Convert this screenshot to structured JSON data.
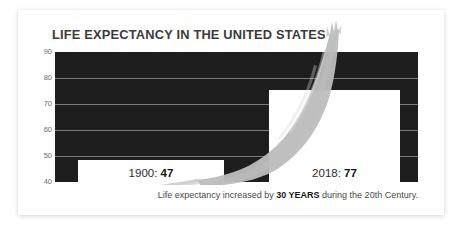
{
  "title": "LIFE EXPECTANCY IN THE UNITED STATES",
  "caption": {
    "prefix": "Life expectancy increased by ",
    "highlight": "30 YEARS",
    "suffix": " during the 20th Century."
  },
  "bars": [
    {
      "label_year": "1900: ",
      "label_value": "47",
      "year": 1900,
      "value": 47
    },
    {
      "label_year": "2018: ",
      "label_value": "77",
      "year": 2018,
      "value": 77
    }
  ],
  "colors": {
    "plot_background": "#1e1e1e",
    "bar_fill": "#ffffff",
    "gridline": "#8d8d8d",
    "brush_stroke": "#bdbdbd",
    "title_text": "#3b3b3b",
    "caption_text": "#4a4a4a",
    "card_background": "#ffffff"
  },
  "chart_data": {
    "type": "bar",
    "title": "LIFE EXPECTANCY IN THE UNITED STATES",
    "xlabel": "",
    "ylabel": "",
    "categories": [
      "1900",
      "2018"
    ],
    "values": [
      47,
      77
    ],
    "data_labels": [
      "1900: 47",
      "2018: 77"
    ],
    "ylim": [
      40,
      90
    ],
    "yticks": [
      40,
      50,
      60,
      70,
      80,
      90
    ],
    "ytick_labels": [
      "40",
      "50",
      "60",
      "70",
      "80",
      "90"
    ],
    "grid": true,
    "grid_axis": "y",
    "legend": false,
    "annotations": [
      "Life expectancy increased by 30 YEARS during the 20th Century."
    ],
    "overlay": {
      "type": "brush-stroke-curve",
      "description": "grey painted brush stroke rising from left-bottom to upper-right, overshooting the top of the plot",
      "approx_points": [
        {
          "x": 1900,
          "y": 44
        },
        {
          "x": 1930,
          "y": 48
        },
        {
          "x": 1950,
          "y": 55
        },
        {
          "x": 1970,
          "y": 66
        },
        {
          "x": 1990,
          "y": 76
        },
        {
          "x": 2018,
          "y": 95
        }
      ]
    }
  },
  "yticks": [
    {
      "label": "90",
      "value": 90
    },
    {
      "label": "80",
      "value": 80
    },
    {
      "label": "70",
      "value": 70
    },
    {
      "label": "60",
      "value": 60
    },
    {
      "label": "50",
      "value": 50
    },
    {
      "label": "40",
      "value": 40
    }
  ]
}
